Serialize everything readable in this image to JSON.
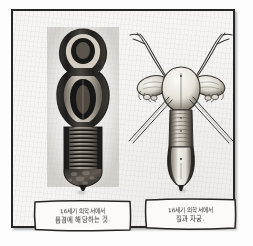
{
  "page": {
    "background_color": "#f6f5f3",
    "frame_color": "#262626"
  },
  "figures": [
    {
      "id": "figure-left",
      "name": "shaded-anatomical-plate",
      "description": "Dark shaded engraving of a dissected vertical anatomical specimen",
      "ink_color": "#2a2724"
    },
    {
      "id": "figure-right",
      "name": "line-anatomical-plate",
      "description": "Line drawing of uterus with fallopian tubes and ovaries",
      "ink_color": "#3a3733"
    }
  ],
  "captions": [
    {
      "id": "caption-left",
      "line1": "16세기 의학서에서",
      "line2": "음경에 해당하는 것."
    },
    {
      "id": "caption-right",
      "line1": "16세기 의학서에서",
      "line2": "질과 자궁."
    }
  ]
}
